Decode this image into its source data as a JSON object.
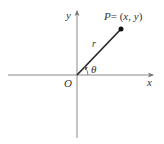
{
  "diagram": {
    "type": "polar-coordinates",
    "labels": {
      "y_axis": "y",
      "x_axis": "x",
      "origin": "O",
      "point_name": "P",
      "point_eq": "= (",
      "point_x": "x",
      "point_sep": ", ",
      "point_y": "y",
      "point_close": ")",
      "radius": "r",
      "angle": "θ"
    },
    "colors": {
      "axis": "#888888",
      "segment": "#222222",
      "point": "#111111",
      "text": "#333333"
    }
  }
}
